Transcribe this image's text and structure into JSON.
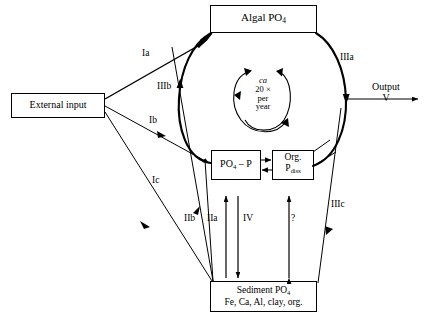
{
  "diagram": {
    "stroke_color": "#000000",
    "background": "#ffffff",
    "nodes": {
      "algal": {
        "label": "Algal PO",
        "sub": "4"
      },
      "external": {
        "label": "External input"
      },
      "po4p": {
        "label": "PO",
        "sub": "4",
        "label2": " – P"
      },
      "orgp": {
        "line1": "Org.",
        "line2": "P",
        "sub2": "diss"
      },
      "sediment": {
        "line1": "Sediment PO",
        "sub1": "4",
        "line2": "Fe, Ca, Al, clay, org."
      }
    },
    "cycle": {
      "line1": "ca",
      "line2": "20 ×",
      "line3": "per",
      "line4": "year"
    },
    "output": {
      "line1": "Output",
      "line2": "V"
    },
    "edge_labels": [
      {
        "id": "Ia",
        "text": "Ia",
        "x": 142,
        "y": 48
      },
      {
        "id": "IIIb",
        "text": "IIIb",
        "x": 157,
        "y": 81
      },
      {
        "id": "Ib",
        "text": "Ib",
        "x": 149,
        "y": 115
      },
      {
        "id": "Ic",
        "text": "Ic",
        "x": 152,
        "y": 175
      },
      {
        "id": "IIb",
        "text": "IIb",
        "x": 186,
        "y": 213
      },
      {
        "id": "IIa",
        "text": "IIa",
        "x": 208,
        "y": 213
      },
      {
        "id": "IV",
        "text": "IV",
        "x": 243,
        "y": 213
      },
      {
        "id": "q",
        "text": "?",
        "x": 291,
        "y": 213
      },
      {
        "id": "IIIa",
        "text": "IIIa",
        "x": 340,
        "y": 52
      },
      {
        "id": "IIIc",
        "text": "IIIc",
        "x": 331,
        "y": 199
      }
    ]
  }
}
